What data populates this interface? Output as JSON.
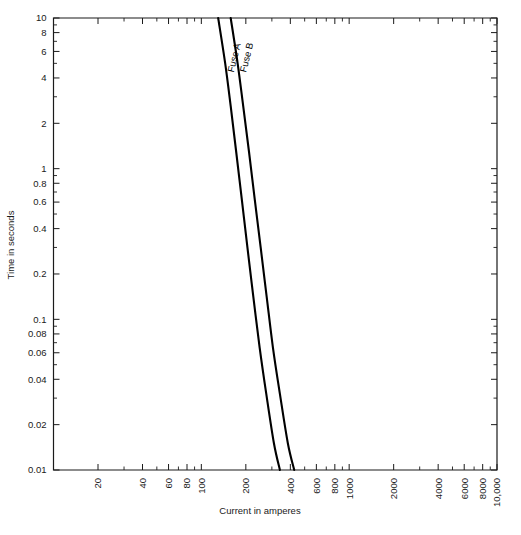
{
  "chart_data": {
    "type": "line",
    "title": "",
    "xlabel": "Current in amperes",
    "ylabel": "Time in seconds",
    "xscale": "log",
    "yscale": "log",
    "xlim": [
      10,
      10000
    ],
    "ylim": [
      0.01,
      10
    ],
    "grid": false,
    "legend": "inline-curve-labels",
    "xticks": [
      {
        "value": 10,
        "label": ""
      },
      {
        "value": 20,
        "label": "20"
      },
      {
        "value": 40,
        "label": "40"
      },
      {
        "value": 60,
        "label": "60"
      },
      {
        "value": 80,
        "label": "80"
      },
      {
        "value": 100,
        "label": "100"
      },
      {
        "value": 200,
        "label": "200"
      },
      {
        "value": 400,
        "label": "400"
      },
      {
        "value": 600,
        "label": "600"
      },
      {
        "value": 800,
        "label": "800"
      },
      {
        "value": 1000,
        "label": "1000"
      },
      {
        "value": 2000,
        "label": "2000"
      },
      {
        "value": 4000,
        "label": "4000"
      },
      {
        "value": 6000,
        "label": "6000"
      },
      {
        "value": 8000,
        "label": "8000"
      },
      {
        "value": 10000,
        "label": "10,000"
      }
    ],
    "xticks_minor": [
      30,
      50,
      70,
      90,
      300,
      500,
      700,
      900,
      3000,
      5000,
      7000,
      9000
    ],
    "yticks": [
      {
        "value": 10,
        "label": "10"
      },
      {
        "value": 8,
        "label": "8"
      },
      {
        "value": 6,
        "label": "6"
      },
      {
        "value": 4,
        "label": "4"
      },
      {
        "value": 2,
        "label": "2"
      },
      {
        "value": 1,
        "label": "1"
      },
      {
        "value": 0.8,
        "label": "0.8"
      },
      {
        "value": 0.6,
        "label": "0.6"
      },
      {
        "value": 0.4,
        "label": "0.4"
      },
      {
        "value": 0.2,
        "label": "0.2"
      },
      {
        "value": 0.1,
        "label": "0.1"
      },
      {
        "value": 0.08,
        "label": "0.08"
      },
      {
        "value": 0.06,
        "label": "0.06"
      },
      {
        "value": 0.04,
        "label": "0.04"
      },
      {
        "value": 0.02,
        "label": "0.02"
      },
      {
        "value": 0.01,
        "label": "0.01"
      }
    ],
    "yticks_minor": [
      9,
      7,
      5,
      3,
      0.9,
      0.7,
      0.5,
      0.3,
      0.09,
      0.07,
      0.05,
      0.03
    ],
    "series": [
      {
        "name": "Fuse A",
        "label": "Fuse A",
        "color": "#000000",
        "points": [
          [
            130,
            10
          ],
          [
            145,
            5
          ],
          [
            158,
            2.6
          ],
          [
            172,
            1.3
          ],
          [
            188,
            0.62
          ],
          [
            205,
            0.3
          ],
          [
            225,
            0.14
          ],
          [
            248,
            0.065
          ],
          [
            275,
            0.032
          ],
          [
            310,
            0.015
          ],
          [
            340,
            0.01
          ]
        ]
      },
      {
        "name": "Fuse B",
        "label": "Fuse B",
        "color": "#000000",
        "points": [
          [
            158,
            10
          ],
          [
            176,
            5
          ],
          [
            192,
            2.6
          ],
          [
            210,
            1.3
          ],
          [
            230,
            0.62
          ],
          [
            252,
            0.3
          ],
          [
            277,
            0.14
          ],
          [
            305,
            0.065
          ],
          [
            340,
            0.032
          ],
          [
            385,
            0.015
          ],
          [
            425,
            0.01
          ]
        ]
      }
    ]
  },
  "axes": {
    "x_title": "Current in amperes",
    "y_title": "Time in seconds"
  },
  "curve_labels": {
    "fuse_a": "Fuse A",
    "fuse_b": "Fuse B"
  },
  "colors": {
    "curve": "#000000",
    "axis": "#1a1a1a",
    "background": "#ffffff"
  }
}
